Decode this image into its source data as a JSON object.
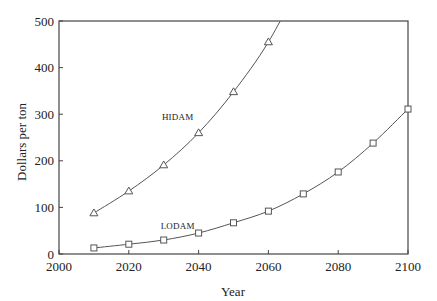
{
  "chart_data": {
    "type": "line",
    "title": "",
    "xlabel": "Year",
    "ylabel": "Dollars per ton",
    "xlim": [
      2000,
      2100
    ],
    "ylim": [
      0,
      500
    ],
    "x_ticks": [
      2000,
      2020,
      2040,
      2060,
      2080,
      2100
    ],
    "y_ticks": [
      0,
      100,
      200,
      300,
      400,
      500
    ],
    "grid": false,
    "legend_position": "inline labels",
    "series": [
      {
        "name": "HIDAM",
        "marker": "triangle",
        "x": [
          2010,
          2020,
          2030,
          2040,
          2050,
          2060
        ],
        "values": [
          88,
          135,
          191,
          260,
          348,
          455
        ],
        "extends_beyond_top_at": 2064,
        "label_pos": {
          "x": 2034,
          "y": 288
        }
      },
      {
        "name": "LODAM",
        "marker": "square",
        "x": [
          2010,
          2020,
          2030,
          2040,
          2050,
          2060,
          2070,
          2080,
          2090,
          2100
        ],
        "values": [
          13,
          21,
          30,
          45,
          67,
          92,
          129,
          176,
          238,
          311
        ],
        "label_pos": {
          "x": 2034,
          "y": 54
        }
      }
    ]
  },
  "colors": {
    "line": "#555555",
    "axis": "#444444",
    "text": "#222222",
    "background": "#ffffff"
  }
}
